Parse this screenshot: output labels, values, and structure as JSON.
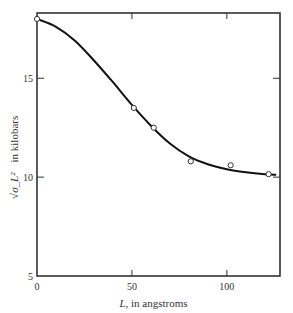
{
  "chart_data": {
    "type": "line",
    "title": "",
    "xlabel": "L, in angstroms",
    "xlabel_italic_part": "L",
    "xlabel_rest": ", in angstroms",
    "ylabel": "√(σ_L²) in kilobars",
    "ylabel_symbol": "√σ_L²",
    "ylabel_rest": "in kilobars",
    "xlim": [
      0,
      128
    ],
    "ylim": [
      5,
      18.3
    ],
    "xticks": [
      0,
      50,
      100
    ],
    "xtick_labels": [
      "0",
      "50",
      "100"
    ],
    "yticks": [
      5,
      10,
      15
    ],
    "ytick_labels": [
      "5",
      "10",
      "15"
    ],
    "grid": false,
    "legend": null,
    "series": [
      {
        "name": "measured",
        "style": "open-circle markers",
        "x": [
          0,
          51,
          61.5,
          81,
          102,
          122
        ],
        "y": [
          18.0,
          13.5,
          12.5,
          10.8,
          10.6,
          10.15
        ]
      },
      {
        "name": "fitted curve",
        "style": "solid line",
        "x": [
          0,
          10,
          20,
          30,
          40,
          50,
          60,
          70,
          80,
          90,
          100,
          110,
          120,
          126
        ],
        "y": [
          18.0,
          17.6,
          16.9,
          15.9,
          14.8,
          13.65,
          12.6,
          11.7,
          11.05,
          10.65,
          10.4,
          10.25,
          10.15,
          10.12
        ]
      }
    ]
  }
}
